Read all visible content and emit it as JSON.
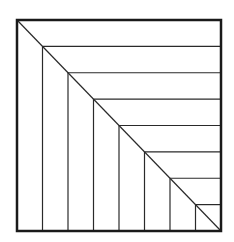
{
  "diagram": {
    "type": "nested-square-staircase",
    "box": {
      "x": 17,
      "y": 20,
      "width": 204,
      "height": 211
    },
    "divisions": 8,
    "colors": {
      "background": "#ffffff",
      "border": "#1a1a1a",
      "lines": "#2a2a2a"
    },
    "stroke": {
      "border": 2.5,
      "lines": 1.2
    }
  }
}
